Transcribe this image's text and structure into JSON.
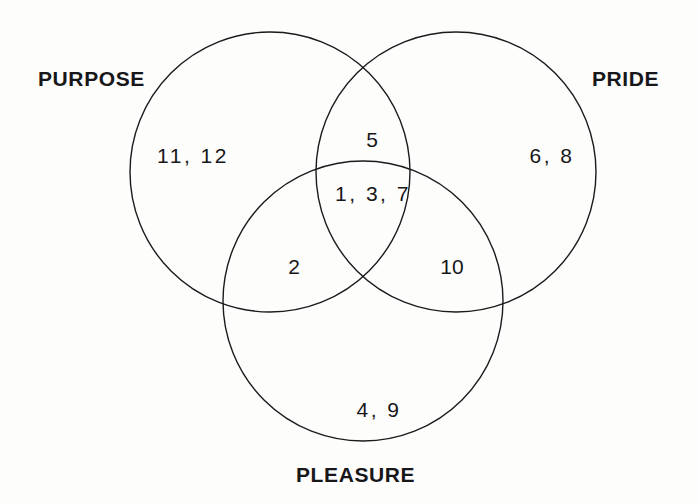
{
  "diagram": {
    "type": "venn",
    "sets": [
      {
        "id": "purpose",
        "label": "PURPOSE"
      },
      {
        "id": "pride",
        "label": "PRIDE"
      },
      {
        "id": "pleasure",
        "label": "PLEASURE"
      }
    ],
    "regions": [
      {
        "id": "purpose-only",
        "items": "11, 12"
      },
      {
        "id": "pride-only",
        "items": "6, 8"
      },
      {
        "id": "pleasure-only",
        "items": "4, 9"
      },
      {
        "id": "purpose-pride",
        "items": "5"
      },
      {
        "id": "purpose-pleasure",
        "items": "2"
      },
      {
        "id": "pride-pleasure",
        "items": "10"
      },
      {
        "id": "all-three",
        "items": "1, 3, 7"
      }
    ],
    "style": {
      "stroke": "#1b1b1e",
      "stroke_width": "1.4",
      "fill": "none",
      "background": "#fdfdfc",
      "text_color": "#17171a"
    }
  }
}
